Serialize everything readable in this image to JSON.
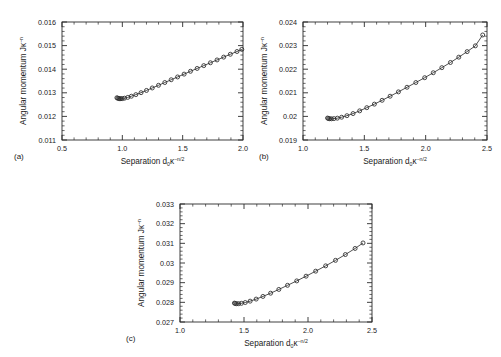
{
  "figure": {
    "background": "#ffffff",
    "line_color": "#3c3c3c",
    "marker_color": "#2b2b2b",
    "axis_color": "#2b2b2b"
  },
  "panels": [
    {
      "id": "a",
      "label": "(a)",
      "xlabel_main": "Separation d",
      "xlabel_sub": "0",
      "xlabel_kappa": "κ",
      "xlabel_sup": "−n/2",
      "ylabel_main": "Angular momentum Jκ",
      "ylabel_sup": "−n",
      "xticks": [
        "0.5",
        "1.0",
        "1.5",
        "2.0"
      ],
      "xtick_values": [
        0.5,
        1.0,
        1.5,
        2.0
      ],
      "yticks": [
        "0.011",
        "0.012",
        "0.013",
        "0.014",
        "0.015",
        "0.016"
      ],
      "ytick_values": [
        0.011,
        0.012,
        0.013,
        0.014,
        0.015,
        0.016
      ]
    },
    {
      "id": "b",
      "label": "(b)",
      "xlabel_main": "Separation d",
      "xlabel_sub": "0",
      "xlabel_kappa": "κ",
      "xlabel_sup": "−n/2",
      "ylabel_main": "Angular momentum Jκ",
      "ylabel_sup": "−n",
      "xticks": [
        "1.0",
        "1.5",
        "2.0",
        "2.5"
      ],
      "xtick_values": [
        1.0,
        1.5,
        2.0,
        2.5
      ],
      "yticks": [
        "0.019",
        "0.02",
        "0.021",
        "0.022",
        "0.023",
        "0.024"
      ],
      "ytick_values": [
        0.019,
        0.02,
        0.021,
        0.022,
        0.023,
        0.024
      ]
    },
    {
      "id": "c",
      "label": "(c)",
      "xlabel_main": "Separation d",
      "xlabel_sub": "0",
      "xlabel_kappa": "κ",
      "xlabel_sup": "−n/2",
      "ylabel_main": "Angular momentum Jκ",
      "ylabel_sup": "−n",
      "xticks": [
        "1.0",
        "1.5",
        "2.0",
        "2.5"
      ],
      "xtick_values": [
        1.0,
        1.5,
        2.0,
        2.5
      ],
      "yticks": [
        "0.027",
        "0.028",
        "0.029",
        "0.03",
        "0.031",
        "0.032",
        "0.033"
      ],
      "ytick_values": [
        0.027,
        0.028,
        0.029,
        0.03,
        0.031,
        0.032,
        0.033
      ]
    }
  ],
  "chart_data": [
    {
      "type": "scatter",
      "panel": "a",
      "title": "",
      "xlabel": "Separation d₀κ⁻ⁿᐟ²",
      "ylabel": "Angular momentum Jκ⁻ⁿ",
      "xlim": [
        0.5,
        2.0
      ],
      "ylim": [
        0.011,
        0.016
      ],
      "grid": false,
      "legend": "none",
      "marker": "open-circle",
      "x": [
        0.955,
        0.962,
        0.97,
        0.978,
        0.988,
        1.0,
        1.018,
        1.045,
        1.075,
        1.112,
        1.155,
        1.2,
        1.248,
        1.3,
        1.352,
        1.405,
        1.458,
        1.512,
        1.565,
        1.62,
        1.675,
        1.73,
        1.785,
        1.84,
        1.895,
        1.95,
        1.99
      ],
      "y": [
        0.01279,
        0.01277,
        0.012758,
        0.012752,
        0.01275,
        0.012755,
        0.012772,
        0.012805,
        0.012855,
        0.012922,
        0.013005,
        0.0131,
        0.013205,
        0.013318,
        0.013435,
        0.013553,
        0.013672,
        0.013792,
        0.013912,
        0.014032,
        0.014152,
        0.014272,
        0.014392,
        0.014512,
        0.014632,
        0.01475,
        0.01484
      ]
    },
    {
      "type": "scatter",
      "panel": "b",
      "title": "",
      "xlabel": "Separation d₀κ⁻ⁿᐟ²",
      "ylabel": "Angular momentum Jκ⁻ⁿ",
      "xlim": [
        1.0,
        2.5
      ],
      "ylim": [
        0.019,
        0.024
      ],
      "grid": false,
      "legend": "none",
      "marker": "open-circle",
      "x": [
        1.2,
        1.208,
        1.218,
        1.232,
        1.252,
        1.28,
        1.315,
        1.358,
        1.408,
        1.462,
        1.52,
        1.582,
        1.645,
        1.71,
        1.778,
        1.848,
        1.92,
        1.992,
        2.062,
        2.132,
        2.202,
        2.27,
        2.338,
        2.405,
        2.465
      ],
      "y": [
        0.01993,
        0.01991,
        0.0199,
        0.019898,
        0.019905,
        0.019925,
        0.019965,
        0.02003,
        0.02012,
        0.020235,
        0.02037,
        0.02052,
        0.020682,
        0.020855,
        0.02104,
        0.021235,
        0.021435,
        0.02164,
        0.02185,
        0.022065,
        0.022285,
        0.02251,
        0.022745,
        0.02299,
        0.02345
      ]
    },
    {
      "type": "scatter",
      "panel": "c",
      "title": "",
      "xlabel": "Separation d₀κ⁻ⁿᐟ²",
      "ylabel": "Angular momentum Jκ⁻ⁿ",
      "xlim": [
        1.0,
        2.5
      ],
      "ylim": [
        0.027,
        0.033
      ],
      "grid": false,
      "legend": "none",
      "marker": "open-circle",
      "x": [
        1.425,
        1.432,
        1.442,
        1.458,
        1.48,
        1.51,
        1.548,
        1.595,
        1.648,
        1.708,
        1.772,
        1.84,
        1.912,
        1.985,
        2.06,
        2.138,
        2.215,
        2.292,
        2.368,
        2.43
      ],
      "y": [
        0.02796,
        0.02794,
        0.02793,
        0.027932,
        0.02795,
        0.02799,
        0.02806,
        0.028165,
        0.0283,
        0.028465,
        0.028655,
        0.028865,
        0.02909,
        0.02933,
        0.029585,
        0.029855,
        0.030135,
        0.03043,
        0.03074,
        0.03102
      ]
    }
  ]
}
